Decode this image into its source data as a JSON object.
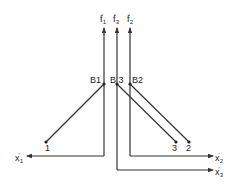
{
  "diagram": {
    "colors": {
      "line": "#333333",
      "text": "#222222",
      "background": "#ffffff"
    },
    "axis_labels": {
      "f1": {
        "base": "f",
        "prime": "'",
        "sub": "1"
      },
      "f3": {
        "base": "f",
        "prime": "'",
        "sub": "3"
      },
      "f2": {
        "base": "f",
        "prime": "'",
        "sub": "2"
      },
      "x1": {
        "base": "x",
        "prime": "'",
        "sub": "1"
      },
      "x2": {
        "base": "x",
        "prime": "'",
        "sub": "2"
      },
      "x3": {
        "base": "x",
        "prime": "'",
        "sub": "3"
      }
    },
    "node_labels": {
      "b1": "B1",
      "b3": "B 3",
      "b2": "B2",
      "p1": "1",
      "p3": "3",
      "p2": "2"
    }
  }
}
